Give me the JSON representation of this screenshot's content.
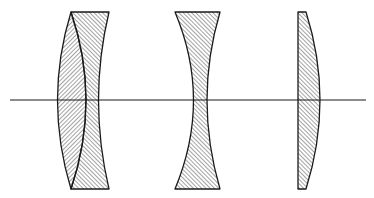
{
  "diagram": {
    "title": "Lens system cross-section",
    "type": "optical lens diagram",
    "colors": {
      "background": "#ffffff",
      "stroke": "#1a1a1a",
      "hatch": "#333333"
    },
    "optical_axis": {
      "x1": 10,
      "x2": 366,
      "y": 100
    },
    "elements": [
      {
        "id": "doublet-front",
        "label": "Biconvex element of cemented doublet",
        "hatch": "right-leaning"
      },
      {
        "id": "doublet-rear",
        "label": "Concave element of cemented doublet",
        "hatch": "left-leaning"
      },
      {
        "id": "biconcave",
        "label": "Biconcave lens",
        "hatch": "left-leaning"
      },
      {
        "id": "plano-convex",
        "label": "Plano-convex lens",
        "hatch": "left-leaning"
      }
    ]
  }
}
